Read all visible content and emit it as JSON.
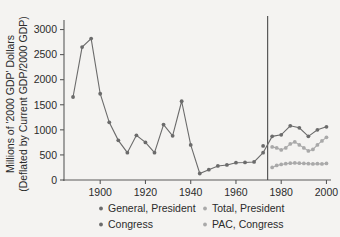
{
  "chart_data": {
    "type": "line",
    "title": "",
    "subtitle": "",
    "xlabel": "",
    "ylabel": "Millions of '2000 GDP' Dollars (Deflated by Current GDP/2000 GDP)",
    "ylabel_line1": "Millions of '2000 GDP' Dollars",
    "ylabel_line2": "(Deflated by Current GDP/2000 GDP)",
    "xlim": [
      1884,
      2002
    ],
    "ylim": [
      0,
      3150
    ],
    "xticks": [
      1900,
      1920,
      1940,
      1960,
      1980,
      2000
    ],
    "xticklabels": [
      "1900",
      "1920",
      "1940",
      "1960",
      "1980",
      "2000"
    ],
    "yticks": [
      0,
      500,
      1000,
      1500,
      2000,
      2500,
      3000
    ],
    "yticklabels": [
      "0",
      "500",
      "1000",
      "1500",
      "2000",
      "2500",
      "3000"
    ],
    "grid": false,
    "legend_position": "below",
    "annotations": [
      {
        "type": "vertical-line",
        "x": 1974,
        "label": ""
      }
    ],
    "series": [
      {
        "name": "General, President",
        "color": "#6b6b6b",
        "marker": "circle",
        "x": [
          1888,
          1892,
          1896,
          1900,
          1904,
          1908,
          1912,
          1916,
          1920,
          1924,
          1928,
          1932,
          1936,
          1940,
          1944,
          1948,
          1952,
          1956,
          1960,
          1964,
          1968,
          1972,
          1976,
          1980,
          1984,
          1988,
          1992,
          1996,
          2000
        ],
        "y": [
          1655,
          2650,
          2820,
          1720,
          1150,
          790,
          545,
          890,
          750,
          545,
          1105,
          880,
          1570,
          700,
          130,
          205,
          280,
          300,
          345,
          350,
          360,
          545,
          870,
          900,
          1080,
          1040,
          870,
          1000,
          1060
        ],
        "values": [
          1655,
          2650,
          2820,
          1720,
          1150,
          790,
          545,
          890,
          750,
          545,
          1105,
          880,
          1570,
          700,
          130,
          205,
          280,
          300,
          345,
          350,
          360,
          545,
          870,
          900,
          1080,
          1040,
          870,
          1000,
          1060
        ]
      },
      {
        "name": "Total, President",
        "color": "#a9a9a9",
        "marker": "circle",
        "x": [
          1976,
          1978,
          1980,
          1982,
          1984,
          1986,
          1988,
          1990,
          1992,
          1994,
          1996,
          1998,
          2000
        ],
        "y": [
          660,
          640,
          600,
          640,
          720,
          760,
          700,
          640,
          580,
          610,
          700,
          780,
          850
        ],
        "values": [
          660,
          640,
          600,
          640,
          720,
          760,
          700,
          640,
          580,
          610,
          700,
          780,
          850
        ]
      },
      {
        "name": "Congress",
        "color": "#6b6b6b",
        "marker": "circle",
        "x": [
          1972
        ],
        "y": [
          680
        ],
        "values": [
          680
        ]
      },
      {
        "name": "PAC, Congress",
        "color": "#a9a9a9",
        "marker": "circle",
        "x": [
          1976,
          1978,
          1980,
          1982,
          1984,
          1986,
          1988,
          1990,
          1992,
          1994,
          1996,
          1998,
          2000
        ],
        "y": [
          250,
          290,
          310,
          325,
          335,
          340,
          335,
          330,
          325,
          320,
          325,
          320,
          330
        ],
        "values": [
          250,
          290,
          310,
          325,
          335,
          340,
          335,
          330,
          325,
          320,
          325,
          320,
          330
        ]
      }
    ],
    "legend": [
      {
        "label": "General, President",
        "color": "#6b6b6b"
      },
      {
        "label": "Total, President",
        "color": "#a9a9a9"
      },
      {
        "label": "Congress",
        "color": "#6b6b6b"
      },
      {
        "label": "PAC, Congress",
        "color": "#a9a9a9"
      }
    ]
  }
}
